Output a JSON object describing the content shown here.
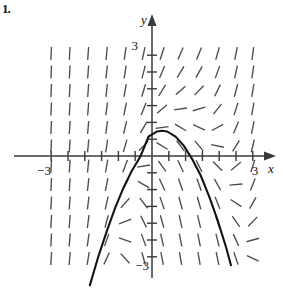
{
  "figure": {
    "corner_label": "1.",
    "axis_labels": {
      "x": "x",
      "y": "y"
    },
    "tick_labels": {
      "x_min": "−3",
      "x_max": "3",
      "y_max": "3",
      "y_min": "−3"
    },
    "colors": {
      "curve": "#141414",
      "axis": "#3a3a3a",
      "slope_mark": "#4d4d4d",
      "background": "#ffffff"
    }
  },
  "chart_data": {
    "type": "line",
    "title": "",
    "subtitle": "",
    "xlabel": "x",
    "ylabel": "y",
    "xlim": [
      -3.4,
      3.4
    ],
    "ylim": [
      -3.6,
      3.6
    ],
    "grid": false,
    "legend": null,
    "x_ticks": [
      -3,
      -2.5,
      -2,
      -1.5,
      -1,
      -0.5,
      0.5,
      1,
      1.5,
      2,
      2.5,
      3
    ],
    "y_ticks": [
      -3,
      -2.5,
      -2,
      -1.5,
      -1,
      -0.5,
      0.5,
      1,
      1.5,
      2,
      2.5,
      3
    ],
    "x_tick_labels": [
      "−3",
      "3"
    ],
    "y_tick_labels": [
      "3",
      "−3"
    ],
    "annotations": [
      "slope field (direction field) of a first-order differential equation",
      "single solution curve: downward-opening parabola"
    ],
    "series": [
      {
        "name": "solution-curve",
        "kind": "parabola",
        "description": "downward opening parabola through the slope field",
        "vertex": [
          0.3,
          0.75
        ],
        "leading_coefficient": -1.05,
        "x": [
          -1.85,
          -1.6,
          -1.35,
          -1.1,
          -0.85,
          -0.6,
          -0.35,
          -0.1,
          0.15,
          0.3,
          0.45,
          0.7,
          0.95,
          1.2,
          1.45,
          1.7,
          1.95,
          2.2,
          2.35
        ],
        "y": [
          -3.85,
          -3.0,
          -2.25,
          -1.55,
          -0.95,
          -0.44,
          -0.02,
          0.58,
          0.73,
          0.75,
          0.73,
          0.58,
          0.3,
          -0.1,
          -0.58,
          -1.2,
          -1.9,
          -2.7,
          -3.25
        ]
      },
      {
        "name": "slope-field",
        "kind": "direction-field",
        "description": "grid of short line segments whose angles vary across the plane",
        "columns": 12,
        "rows": 12,
        "x_positions": [
          -3.0,
          -2.45,
          -1.9,
          -1.35,
          -0.8,
          -0.25,
          0.3,
          0.85,
          1.4,
          1.95,
          2.5,
          3.0
        ],
        "y_positions": [
          3.05,
          2.5,
          1.95,
          1.4,
          0.85,
          0.3,
          -0.3,
          -0.85,
          -1.4,
          -1.95,
          -2.5,
          -3.05
        ]
      }
    ]
  }
}
